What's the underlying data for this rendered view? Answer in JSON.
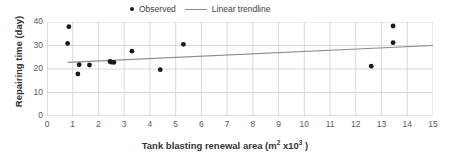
{
  "chart_data": {
    "type": "scatter",
    "title": "",
    "xlabel": "Tank blasting renewal area (m² x10³ )",
    "ylabel": "Repairing time (day)",
    "xlim": [
      0,
      15
    ],
    "ylim": [
      0,
      40
    ],
    "xticks": [
      0,
      1,
      2,
      3,
      4,
      5,
      6,
      7,
      8,
      9,
      10,
      11,
      12,
      13,
      14,
      15
    ],
    "yticks": [
      0,
      10,
      20,
      30,
      40
    ],
    "grid": true,
    "legend_position": "top-center",
    "series": [
      {
        "name": "Observed",
        "type": "scatter",
        "marker": "circle",
        "color": "#1a1a1a",
        "points": [
          [
            0.8,
            30.9
          ],
          [
            0.85,
            38.0
          ],
          [
            1.2,
            17.9
          ],
          [
            1.25,
            21.8
          ],
          [
            1.65,
            21.7
          ],
          [
            2.45,
            23.2
          ],
          [
            2.5,
            22.9
          ],
          [
            2.6,
            22.8
          ],
          [
            3.3,
            27.6
          ],
          [
            4.4,
            19.7
          ],
          [
            5.3,
            30.5
          ],
          [
            12.6,
            21.2
          ],
          [
            13.45,
            38.3
          ],
          [
            13.45,
            31.2
          ]
        ]
      },
      {
        "name": "Linear trendline",
        "type": "line",
        "color": "#8c8c8c",
        "points": [
          [
            0.8,
            22.8
          ],
          [
            15.0,
            30.0
          ]
        ]
      }
    ]
  },
  "legend": {
    "entries": [
      {
        "label": "Observed",
        "marker": "dot"
      },
      {
        "label": "Linear trendline",
        "marker": "line"
      }
    ]
  },
  "axes": {
    "x_title_main": "Tank blasting renewal area (m",
    "x_title_sup1": "2",
    "x_title_mid": " x10",
    "x_title_sup2": "3",
    "x_title_end": " )",
    "y_title": "Repairing time (day)"
  },
  "colors": {
    "marker": "#1a1a1a",
    "trendline": "#8c8c8c",
    "gridline": "#d9d9d9",
    "axis": "#bfbfbf",
    "tick_text": "#595959",
    "title_text": "#333333",
    "background": "#ffffff"
  }
}
